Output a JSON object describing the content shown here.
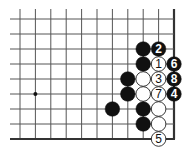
{
  "diagram": {
    "type": "go-board-fragment",
    "grid": {
      "columns_x": [
        20,
        35.4,
        50.8,
        66.2,
        81.6,
        97,
        112.4,
        127.8,
        143.2,
        158.6,
        174
      ],
      "rows_y": [
        19,
        34,
        49,
        64,
        79,
        94,
        109,
        124,
        139
      ],
      "left_extend": 10,
      "top_extend": 10,
      "right_edge": true,
      "bottom_edge": true,
      "line_color": "#555555",
      "edge_color": "#333333"
    },
    "star_points": [
      {
        "col": 1,
        "row": 5
      }
    ],
    "stones": [
      {
        "col": 8,
        "row": 2,
        "color": "black",
        "label": ""
      },
      {
        "col": 9,
        "row": 2,
        "color": "black",
        "label": "2"
      },
      {
        "col": 8,
        "row": 3,
        "color": "black",
        "label": ""
      },
      {
        "col": 9,
        "row": 3,
        "color": "white",
        "label": "1"
      },
      {
        "col": 10,
        "row": 3,
        "color": "black",
        "label": "6"
      },
      {
        "col": 7,
        "row": 4,
        "color": "black",
        "label": ""
      },
      {
        "col": 8,
        "row": 4,
        "color": "white",
        "label": ""
      },
      {
        "col": 9,
        "row": 4,
        "color": "white",
        "label": "3"
      },
      {
        "col": 10,
        "row": 4,
        "color": "black",
        "label": "8"
      },
      {
        "col": 7,
        "row": 5,
        "color": "black",
        "label": ""
      },
      {
        "col": 8,
        "row": 5,
        "color": "white",
        "label": ""
      },
      {
        "col": 9,
        "row": 5,
        "color": "white",
        "label": "7"
      },
      {
        "col": 10,
        "row": 5,
        "color": "black",
        "label": "4"
      },
      {
        "col": 6,
        "row": 6,
        "color": "black",
        "label": ""
      },
      {
        "col": 8,
        "row": 6,
        "color": "black",
        "label": ""
      },
      {
        "col": 9,
        "row": 6,
        "color": "white",
        "label": ""
      },
      {
        "col": 8,
        "row": 7,
        "color": "black",
        "label": ""
      },
      {
        "col": 9,
        "row": 7,
        "color": "white",
        "label": ""
      },
      {
        "col": 9,
        "row": 8,
        "color": "white",
        "label": "5"
      }
    ],
    "stone_radius": 7.3,
    "colors": {
      "black_stone": "#111111",
      "white_stone": "#ffffff",
      "white_outline": "#222222",
      "label_on_black": "#ffffff",
      "label_on_white": "#111111"
    }
  }
}
